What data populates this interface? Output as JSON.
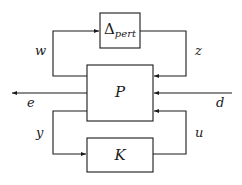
{
  "diagram": {
    "type": "block-diagram",
    "title": "",
    "blocks": [
      {
        "id": "delta",
        "symbol": "Δ",
        "subscript": "pert"
      },
      {
        "id": "plant",
        "symbol": "P"
      },
      {
        "id": "controller",
        "symbol": "K"
      }
    ],
    "signals": [
      {
        "label": "w",
        "from": "plant",
        "to": "delta"
      },
      {
        "label": "z",
        "from": "delta",
        "to": "plant"
      },
      {
        "label": "e",
        "from": "plant",
        "to": "output"
      },
      {
        "label": "d",
        "from": "input",
        "to": "plant"
      },
      {
        "label": "y",
        "from": "plant",
        "to": "controller"
      },
      {
        "label": "u",
        "from": "controller",
        "to": "plant"
      }
    ],
    "colors": {
      "line": "#1a1a1a",
      "background": "#ffffff"
    }
  }
}
